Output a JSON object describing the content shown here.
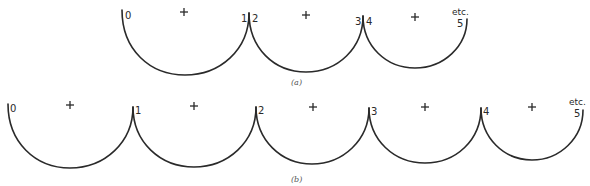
{
  "figure": {
    "caption_a": "(a)",
    "caption_b": "(b)",
    "etc_label": "etc."
  },
  "row_a": {
    "points": [
      "0",
      "1",
      "2",
      "3",
      "4",
      "5"
    ],
    "arcs": [
      {
        "from": "0",
        "to": "1",
        "x1": 122,
        "y1": 10,
        "x2": 249,
        "y2": 13,
        "bottom": 75,
        "cross": [
          184,
          12
        ]
      },
      {
        "from": "2",
        "to": "3",
        "x1": 249,
        "y1": 13,
        "x2": 363,
        "y2": 16,
        "bottom": 72,
        "cross": [
          306,
          15
        ]
      },
      {
        "from": "4",
        "to": "5",
        "x1": 363,
        "y1": 16,
        "x2": 467,
        "y2": 19,
        "bottom": 68,
        "cross": [
          415,
          17
        ]
      }
    ]
  },
  "row_b": {
    "points": [
      "0",
      "1",
      "2",
      "3",
      "4",
      "5"
    ],
    "arcs": [
      {
        "from": "0",
        "to": "1",
        "x1": 8,
        "y1": 104,
        "x2": 133,
        "y2": 107,
        "bottom": 168,
        "cross": [
          70,
          105
        ]
      },
      {
        "from": "1",
        "to": "2",
        "x1": 133,
        "y1": 107,
        "x2": 256,
        "y2": 107,
        "bottom": 167,
        "cross": [
          194,
          106
        ]
      },
      {
        "from": "2",
        "to": "3",
        "x1": 256,
        "y1": 107,
        "x2": 369,
        "y2": 108,
        "bottom": 164,
        "cross": [
          313,
          107
        ]
      },
      {
        "from": "3",
        "to": "4",
        "x1": 369,
        "y1": 108,
        "x2": 481,
        "y2": 108,
        "bottom": 163,
        "cross": [
          425,
          107
        ]
      },
      {
        "from": "4",
        "to": "5",
        "x1": 481,
        "y1": 108,
        "x2": 583,
        "y2": 110,
        "bottom": 160,
        "cross": [
          532,
          107
        ]
      }
    ]
  }
}
